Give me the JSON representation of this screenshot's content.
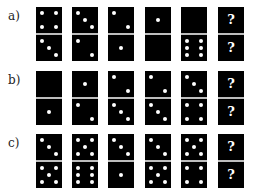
{
  "rows": [
    {
      "label": "a)",
      "top": 7,
      "dominoes": [
        {
          "top": 4,
          "bottom": 3
        },
        {
          "top": 3,
          "bottom": 2
        },
        {
          "top": 2,
          "bottom": 1
        },
        {
          "top": 1,
          "bottom": 0
        },
        {
          "top": 0,
          "bottom": 6
        },
        {
          "top": "?",
          "bottom": "?"
        }
      ]
    },
    {
      "label": "b)",
      "top": 71,
      "dominoes": [
        {
          "top": 0,
          "bottom": 1
        },
        {
          "top": 1,
          "bottom": 2
        },
        {
          "top": 2,
          "bottom": 3
        },
        {
          "top": 2,
          "bottom": 3
        },
        {
          "top": 3,
          "bottom": 4
        },
        {
          "top": "?",
          "bottom": "?"
        }
      ]
    },
    {
      "label": "c)",
      "top": 134,
      "dominoes": [
        {
          "top": 3,
          "bottom": 5
        },
        {
          "top": 5,
          "bottom": 6
        },
        {
          "top": 3,
          "bottom": 1
        },
        {
          "top": 3,
          "bottom": 5
        },
        {
          "top": 5,
          "bottom": 4
        },
        {
          "top": "?",
          "bottom": "?"
        }
      ]
    }
  ],
  "domino_x": [
    36,
    72,
    108,
    145,
    181,
    218
  ],
  "unknown_symbol": "?"
}
